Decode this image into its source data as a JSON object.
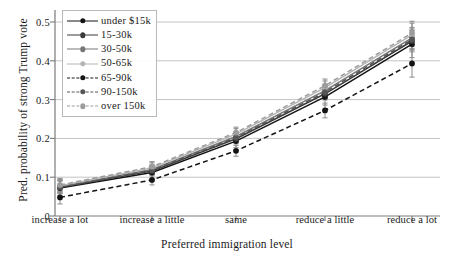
{
  "chart_data": {
    "type": "line",
    "title": "",
    "xlabel": "Preferred immigration level",
    "ylabel": "Pred. probability of strong Trump vote",
    "categories": [
      "increase a lot",
      "increase a little",
      "same",
      "reduce a little",
      "reduce a lot"
    ],
    "ylim": [
      0,
      0.53
    ],
    "yticks": [
      0,
      0.1,
      0.2,
      0.3,
      0.4,
      0.5
    ],
    "ytick_labels": [
      "0",
      "0.1",
      "0.2",
      "0.3",
      "0.4",
      "0.5"
    ],
    "grid": "horizontal",
    "legend_position": "upper left",
    "series": [
      {
        "name": "under $15k",
        "color": "#141414",
        "dash": "solid",
        "values": [
          0.072,
          0.112,
          0.193,
          0.307,
          0.443
        ],
        "err_low": [
          0.052,
          0.096,
          0.176,
          0.286,
          0.408
        ],
        "err_high": [
          0.093,
          0.13,
          0.211,
          0.329,
          0.478
        ]
      },
      {
        "name": "15-30k",
        "color": "#3a3a3a",
        "dash": "solid",
        "values": [
          0.074,
          0.116,
          0.199,
          0.315,
          0.451
        ],
        "err_low": [
          0.057,
          0.103,
          0.186,
          0.299,
          0.423
        ],
        "err_high": [
          0.091,
          0.129,
          0.212,
          0.331,
          0.479
        ]
      },
      {
        "name": "30-50k",
        "color": "#777777",
        "dash": "solid",
        "values": [
          0.076,
          0.12,
          0.205,
          0.323,
          0.459
        ],
        "err_low": [
          0.06,
          0.108,
          0.193,
          0.308,
          0.432
        ],
        "err_high": [
          0.092,
          0.132,
          0.217,
          0.338,
          0.486
        ]
      },
      {
        "name": "50-65k",
        "color": "#b4b4b4",
        "dash": "solid",
        "values": [
          0.078,
          0.124,
          0.211,
          0.331,
          0.467
        ],
        "err_low": [
          0.061,
          0.111,
          0.197,
          0.314,
          0.437
        ],
        "err_high": [
          0.095,
          0.137,
          0.225,
          0.348,
          0.497
        ]
      },
      {
        "name": "65-90k",
        "color": "#141414",
        "dash": "dashed",
        "values": [
          0.048,
          0.093,
          0.168,
          0.272,
          0.393
        ],
        "err_low": [
          0.031,
          0.08,
          0.154,
          0.253,
          0.358
        ],
        "err_high": [
          0.065,
          0.106,
          0.182,
          0.291,
          0.428
        ]
      },
      {
        "name": "90-150k",
        "color": "#555555",
        "dash": "dashed",
        "values": [
          0.074,
          0.118,
          0.202,
          0.319,
          0.455
        ],
        "err_low": [
          0.058,
          0.106,
          0.19,
          0.304,
          0.428
        ],
        "err_high": [
          0.09,
          0.13,
          0.214,
          0.334,
          0.482
        ]
      },
      {
        "name": "over 150k",
        "color": "#9c9c9c",
        "dash": "dashed",
        "values": [
          0.08,
          0.127,
          0.215,
          0.336,
          0.472
        ],
        "err_low": [
          0.063,
          0.114,
          0.201,
          0.319,
          0.442
        ],
        "err_high": [
          0.097,
          0.14,
          0.229,
          0.353,
          0.502
        ]
      }
    ]
  },
  "axes": {
    "grid_color": "#c4c4c4",
    "spine_color": "#7a7a7a"
  }
}
